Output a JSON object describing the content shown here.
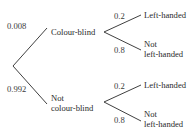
{
  "tree": {
    "level1": [
      {
        "probability": "0.008",
        "label": "Colour-blind"
      },
      {
        "probability": "0.992",
        "label_line1": "Not",
        "label_line2": "colour-blind"
      }
    ],
    "level2_colour_blind": [
      {
        "probability": "0.2",
        "label": "Left-handed"
      },
      {
        "probability": "0.8",
        "label_line1": "Not",
        "label_line2": "left-handed"
      }
    ],
    "level2_not_colour_blind": [
      {
        "probability": "0.2",
        "label": "Left-handed"
      },
      {
        "probability": "0.8",
        "label_line1": "Not",
        "label_line2": "left-handed"
      }
    ]
  }
}
